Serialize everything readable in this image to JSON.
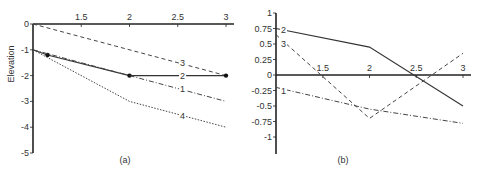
{
  "chart_data": [
    {
      "id": "a",
      "type": "line",
      "title": "",
      "caption": "(a)",
      "xlabel": "",
      "ylabel": "Elevation",
      "xlim": [
        1,
        3
      ],
      "ylim": [
        -5,
        0
      ],
      "x_ticks": [
        "1.5",
        "2",
        "2.5",
        "3"
      ],
      "y_ticks": [
        "0",
        "-1",
        "-2",
        "-3",
        "-4",
        "-5"
      ],
      "grid": false,
      "x_axis_position": "top (y=0)",
      "series": [
        {
          "name": "3",
          "style": "dashed",
          "x": [
            1,
            3
          ],
          "values": [
            0,
            -2
          ],
          "label_pos": [
            2.55,
            -1.5
          ]
        },
        {
          "name": "2",
          "style": "solid-with-markers",
          "x": [
            1,
            1.15,
            2,
            3
          ],
          "values": [
            -1,
            -1.2,
            -2,
            -2
          ],
          "markers_at": [
            1.15,
            2,
            3
          ],
          "label_pos": [
            2.55,
            -2
          ]
        },
        {
          "name": "1",
          "style": "dash-dot",
          "x": [
            1,
            2,
            3
          ],
          "values": [
            -1,
            -2,
            -3
          ],
          "label_pos": [
            2.55,
            -2.5
          ]
        },
        {
          "name": "4",
          "style": "dotted",
          "x": [
            1,
            2,
            3
          ],
          "values": [
            -1,
            -3,
            -4
          ],
          "label_pos": [
            2.55,
            -3.55
          ]
        }
      ]
    },
    {
      "id": "b",
      "type": "line",
      "title": "",
      "caption": "(b)",
      "xlabel": "",
      "ylabel": "",
      "xlim": [
        1,
        3
      ],
      "ylim": [
        -1.25,
        1
      ],
      "x_ticks": [
        "1.5",
        "2",
        "2.5",
        "3"
      ],
      "y_ticks": [
        "1",
        "0.75",
        "0.5",
        "0.25",
        "0",
        "-0.25",
        "-0.5",
        "-0.75",
        "-1"
      ],
      "grid": false,
      "x_axis_position": "y=0",
      "series": [
        {
          "name": "2",
          "style": "solid",
          "x": [
            1,
            2,
            3
          ],
          "values": [
            0.75,
            0.45,
            -0.5
          ],
          "label_pos": [
            1.08,
            0.72
          ]
        },
        {
          "name": "3",
          "style": "dashed",
          "x": [
            1,
            2,
            3
          ],
          "values": [
            0.65,
            -0.7,
            0.35
          ],
          "label_pos": [
            1.08,
            0.5
          ]
        },
        {
          "name": "1",
          "style": "dash-dot",
          "x": [
            1,
            2,
            3
          ],
          "values": [
            -0.2,
            -0.55,
            -0.78
          ],
          "label_pos": [
            1.08,
            -0.25
          ]
        }
      ]
    }
  ]
}
